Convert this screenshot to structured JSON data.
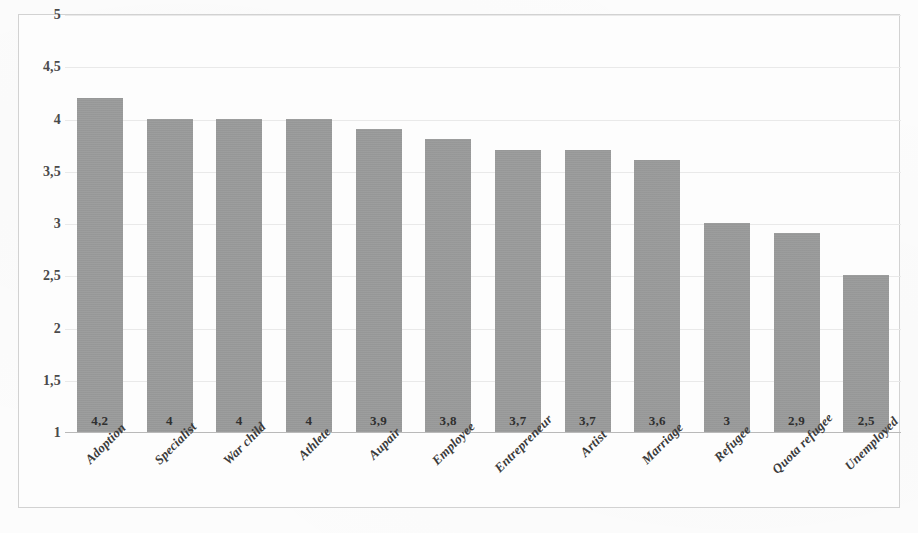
{
  "chart_data": {
    "type": "bar",
    "title": "",
    "subtitle": "",
    "xlabel": "",
    "ylabel": "",
    "categories": [
      "Adoption",
      "Specialist",
      "War child",
      "Athlete",
      "Aupair",
      "Employee",
      "Entrepreneur",
      "Artist",
      "Marriage",
      "Refugee",
      "Quota refugee",
      "Unemployed"
    ],
    "values": [
      4.2,
      4,
      4,
      4,
      3.9,
      3.8,
      3.7,
      3.7,
      3.6,
      3,
      2.9,
      2.5
    ],
    "value_labels": [
      "4,2",
      "4",
      "4",
      "4",
      "3,9",
      "3,8",
      "3,7",
      "3,7",
      "3,6",
      "3",
      "2,9",
      "2,5"
    ],
    "ylim": [
      1,
      5
    ],
    "ytick_values": [
      5,
      4.5,
      4,
      3.5,
      3,
      2.5,
      2,
      1.5,
      1
    ],
    "ytick_labels": [
      "5",
      "4,5",
      "4",
      "3,5",
      "3",
      "2,5",
      "2",
      "1,5",
      "1"
    ],
    "grid": true,
    "legend": "none",
    "decimal_separator": ",",
    "bar_color": "#9a9b9b",
    "gridline_color": "#e9e9e9",
    "axis_color": "#b9b9b9",
    "frame_color": "#d2d2d2",
    "background_color": "#fdfdfd"
  }
}
